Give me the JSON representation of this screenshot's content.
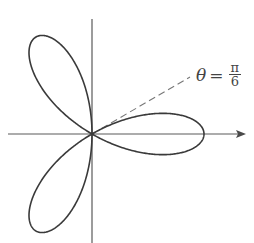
{
  "diagram": {
    "type": "polar rose curve",
    "curve": "r = cos(3θ)",
    "petals": 3,
    "petal_directions_deg": [
      0,
      120,
      240
    ],
    "annotation": {
      "symbol": "θ",
      "equals": "=",
      "numerator": "π",
      "denominator": "6",
      "line_angle_deg": 30,
      "line_style": "dashed"
    },
    "axes": {
      "horizontal_arrow": true,
      "vertical_arrow": false
    },
    "colors": {
      "curve": "#3a3a3a",
      "axes": "#5a5a5a",
      "dashed": "#777777",
      "background": "#ffffff"
    }
  }
}
